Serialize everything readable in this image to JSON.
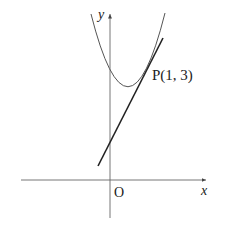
{
  "diagram": {
    "axis_labels": {
      "x": "x",
      "y": "y",
      "origin": "O"
    },
    "point_label": "P(1, 3)",
    "curve": "parabola",
    "tangent_line": "tangent at P",
    "colors": {
      "stroke": "#222222",
      "curve": "#555555",
      "axis": "#666666"
    }
  }
}
